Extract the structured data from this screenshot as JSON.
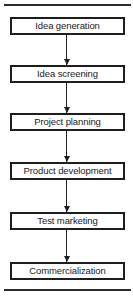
{
  "diagram": {
    "type": "flowchart",
    "direction": "top-to-bottom",
    "steps": [
      {
        "label": "Idea generation"
      },
      {
        "label": "Idea screening"
      },
      {
        "label": "Project planning"
      },
      {
        "label": "Product development"
      },
      {
        "label": "Test marketing"
      },
      {
        "label": "Commercialization"
      }
    ],
    "connectors": [
      {
        "from": "Idea generation",
        "to": "Idea screening"
      },
      {
        "from": "Idea screening",
        "to": "Project planning"
      },
      {
        "from": "Project planning",
        "to": "Product development"
      },
      {
        "from": "Product development",
        "to": "Test marketing"
      },
      {
        "from": "Test marketing",
        "to": "Commercialization"
      }
    ],
    "colors": {
      "line": "#1e1e1e",
      "background": "#ffffff",
      "text": "#1a1a1a"
    }
  }
}
